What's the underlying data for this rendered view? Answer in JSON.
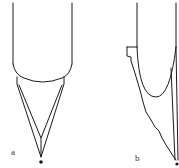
{
  "figure": {
    "type": "technical line drawing",
    "panels": [
      {
        "id": "a",
        "label": "a",
        "description": "Tube with rounded end and symmetric V-shaped pointed tip, inner V and dot at apex"
      },
      {
        "id": "b",
        "label": "b",
        "description": "Tube with U-shaped rounded end, flange step and asymmetric jagged tapering tip with dot at apex"
      }
    ],
    "colors": {
      "line": "#1a1a1a",
      "background": "#ffffff",
      "label": "#333333"
    }
  }
}
